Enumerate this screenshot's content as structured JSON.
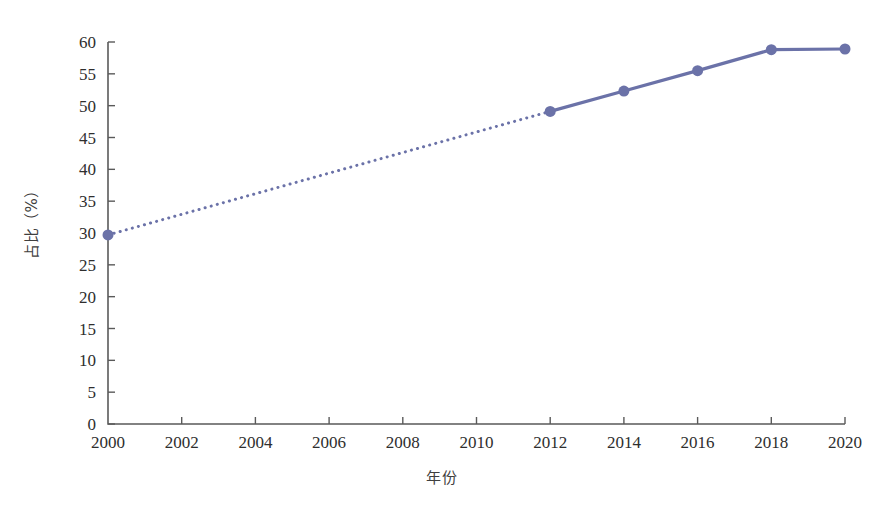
{
  "chart_data": {
    "type": "line",
    "title": "",
    "subtitle": "",
    "xlabel": "年份",
    "ylabel": "占比（%）",
    "xlim": [
      2000,
      2020
    ],
    "ylim": [
      0,
      60
    ],
    "grid": false,
    "legend": null,
    "legend_position": "none",
    "accent_color": "#6b72a8",
    "axis_color": "#5a5a5a",
    "background_color": "#ffffff",
    "x_ticks": [
      "2000",
      "2002",
      "2004",
      "2006",
      "2008",
      "2010",
      "2012",
      "2014",
      "2016",
      "2018",
      "2020"
    ],
    "y_ticks": [
      "0",
      "5",
      "10",
      "15",
      "20",
      "25",
      "30",
      "35",
      "40",
      "45",
      "50",
      "55",
      "60"
    ],
    "x": [
      2000,
      2012,
      2014,
      2016,
      2018,
      2020
    ],
    "values": [
      29.7,
      49.1,
      52.3,
      55.5,
      58.8,
      58.9
    ],
    "series": [
      {
        "name": "占比",
        "x": [
          2000,
          2012,
          2014,
          2016,
          2018,
          2020
        ],
        "values": [
          29.7,
          49.1,
          52.3,
          55.5,
          58.8,
          58.9
        ],
        "color": "#6b72a8",
        "marker": "circle",
        "marker_size": 11
      }
    ],
    "segments": [
      {
        "style": "dotted",
        "x": [
          2000,
          2012
        ],
        "values": [
          29.7,
          49.1
        ],
        "note": "interpolated gap between 2000 and 2012"
      },
      {
        "style": "solid",
        "x": [
          2012,
          2014,
          2016,
          2018,
          2020
        ],
        "values": [
          49.1,
          52.3,
          55.5,
          58.8,
          58.9
        ]
      }
    ],
    "annotations": []
  }
}
